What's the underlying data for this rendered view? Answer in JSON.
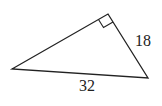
{
  "diagram": {
    "type": "right-triangle",
    "vertices": {
      "left": [
        12,
        69
      ],
      "top": [
        108,
        14
      ],
      "right": [
        148,
        78
      ]
    },
    "right_angle_at": "top",
    "labels": {
      "hypotenuse": "32",
      "short_leg": "18"
    },
    "stroke_color": "#222222",
    "background": "#ffffff"
  }
}
